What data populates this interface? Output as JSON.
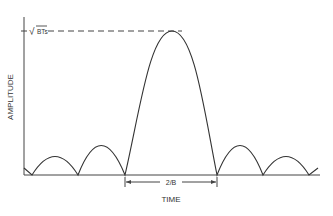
{
  "diagram": {
    "y_axis_label": "AMPLITUDE",
    "x_axis_label": "TIME",
    "peak_label_radicand": "BTs",
    "peak_label_sqrt": "√",
    "main_lobe_width_label": "2/B",
    "line_color": "#333333",
    "background": "#ffffff"
  }
}
